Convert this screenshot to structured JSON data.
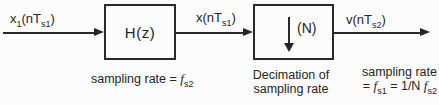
{
  "colors": {
    "background": "#fcfcfc",
    "ink": "#262626"
  },
  "signals": {
    "input": {
      "pre": "x",
      "presub": "1",
      "open": "(nT",
      "sub": "s1",
      "close": ")"
    },
    "filtered": {
      "pre": "x",
      "presub": "",
      "open": "(nT",
      "sub": "s1",
      "close": ")"
    },
    "output": {
      "pre": "v",
      "presub": "",
      "open": "(nT",
      "sub": "s2",
      "close": ")"
    }
  },
  "blocks": {
    "filter": {
      "label": "H(z)"
    },
    "decimator": {
      "label": "(N)",
      "icon": "downsample-arrow"
    }
  },
  "captions": {
    "filter": {
      "prefix": "sampling rate = ",
      "f": "f",
      "fsub": "s2"
    },
    "decimator": {
      "line1": "Decimation of",
      "line2": "sampling rate"
    },
    "output": {
      "line1": "sampling rate",
      "eq": "= ",
      "f1": "f",
      "f1sub": "s1",
      "mid": " = 1/N ",
      "f2": "f",
      "f2sub": "s2"
    }
  }
}
